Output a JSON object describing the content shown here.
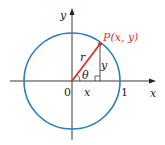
{
  "diagram": {
    "type": "unit-circle",
    "colors": {
      "circle": "#2a7fc1",
      "radius": "#d9322c",
      "axes": "#222222",
      "point_label": "#d9322c"
    },
    "labels": {
      "y_axis": "y",
      "x_axis": "x",
      "origin": "0",
      "one": "1",
      "point": "P(x, y)",
      "radius": "r",
      "angle": "θ",
      "leg_y": "y",
      "leg_x": "x"
    }
  }
}
